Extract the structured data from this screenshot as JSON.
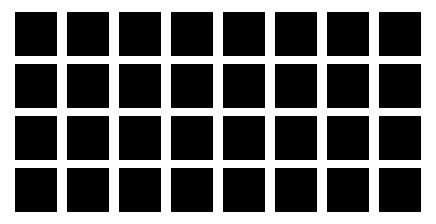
{
  "grid": {
    "rows": 4,
    "columns": 8,
    "cell_color": "#000000",
    "background_color": "#ffffff"
  }
}
